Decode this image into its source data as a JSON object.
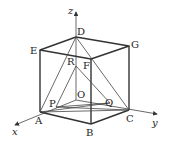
{
  "diagram": {
    "axes": {
      "x": "x",
      "y": "y",
      "z": "z"
    },
    "points": {
      "O": "O",
      "A": "A",
      "B": "B",
      "C": "C",
      "D": "D",
      "E": "E",
      "F": "F",
      "G": "G",
      "P": "P",
      "Q": "Q",
      "R": "R"
    },
    "stroke_color": "#333333",
    "background": "#ffffff"
  }
}
